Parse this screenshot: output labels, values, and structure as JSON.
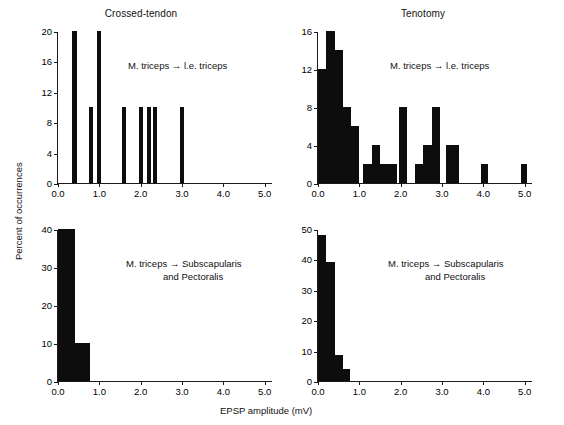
{
  "figure": {
    "ylabel": "Percent of occurrences",
    "xlabel": "EPSP amplitude (mV)"
  },
  "chart_data": [
    {
      "type": "bar",
      "panel_id": "top-left",
      "title": "Crossed-tendon",
      "annotation": "M. triceps → l.e. triceps",
      "xlabel": "EPSP amplitude (mV)",
      "ylabel": "Percent of occurrences",
      "xlim": [
        0.0,
        5.2
      ],
      "ylim": [
        0,
        20
      ],
      "xticks": [
        0.0,
        1.0,
        2.0,
        3.0,
        4.0,
        5.0
      ],
      "xtick_labels": [
        "0.0",
        "1.0",
        "2.0",
        "3.0",
        "4.0",
        "5.0"
      ],
      "yticks": [
        0,
        4,
        8,
        12,
        16,
        20
      ],
      "ytick_labels": [
        "0",
        "4",
        "8",
        "12",
        "16",
        "20"
      ],
      "bin_width": 0.1,
      "grid": false,
      "legend": "none",
      "bars": [
        {
          "x0": 0.35,
          "x1": 0.45,
          "value": 20
        },
        {
          "x0": 0.75,
          "x1": 0.85,
          "value": 10
        },
        {
          "x0": 0.95,
          "x1": 1.05,
          "value": 20
        },
        {
          "x0": 1.55,
          "x1": 1.65,
          "value": 10
        },
        {
          "x0": 1.95,
          "x1": 2.05,
          "value": 10
        },
        {
          "x0": 2.15,
          "x1": 2.25,
          "value": 10
        },
        {
          "x0": 2.3,
          "x1": 2.4,
          "value": 10
        },
        {
          "x0": 2.95,
          "x1": 3.05,
          "value": 10
        }
      ]
    },
    {
      "type": "bar",
      "panel_id": "top-right",
      "title": "Tenotomy",
      "annotation": "M. triceps → l.e. triceps",
      "xlabel": "EPSP amplitude (mV)",
      "ylabel": "Percent of occurrences",
      "xlim": [
        0.0,
        5.2
      ],
      "ylim": [
        0,
        16
      ],
      "xticks": [
        0.0,
        1.0,
        2.0,
        3.0,
        4.0,
        5.0
      ],
      "xtick_labels": [
        "0.0",
        "1.0",
        "2.0",
        "3.0",
        "4.0",
        "5.0"
      ],
      "yticks": [
        0,
        4,
        8,
        12,
        16
      ],
      "ytick_labels": [
        "0",
        "4",
        "8",
        "12",
        "16"
      ],
      "bin_width": 0.2,
      "grid": false,
      "legend": "none",
      "bars": [
        {
          "x0": 0.0,
          "x1": 0.2,
          "value": 12
        },
        {
          "x0": 0.2,
          "x1": 0.4,
          "value": 16
        },
        {
          "x0": 0.4,
          "x1": 0.6,
          "value": 14
        },
        {
          "x0": 0.6,
          "x1": 0.8,
          "value": 8
        },
        {
          "x0": 0.8,
          "x1": 1.0,
          "value": 6
        },
        {
          "x0": 1.1,
          "x1": 1.3,
          "value": 2
        },
        {
          "x0": 1.3,
          "x1": 1.5,
          "value": 4
        },
        {
          "x0": 1.5,
          "x1": 1.7,
          "value": 2
        },
        {
          "x0": 1.7,
          "x1": 1.9,
          "value": 2
        },
        {
          "x0": 1.95,
          "x1": 2.15,
          "value": 8
        },
        {
          "x0": 2.35,
          "x1": 2.55,
          "value": 2
        },
        {
          "x0": 2.55,
          "x1": 2.75,
          "value": 4
        },
        {
          "x0": 2.75,
          "x1": 2.95,
          "value": 8
        },
        {
          "x0": 3.1,
          "x1": 3.25,
          "value": 4
        },
        {
          "x0": 3.25,
          "x1": 3.4,
          "value": 4
        },
        {
          "x0": 3.95,
          "x1": 4.1,
          "value": 2
        },
        {
          "x0": 4.9,
          "x1": 5.05,
          "value": 2
        }
      ]
    },
    {
      "type": "bar",
      "panel_id": "bottom-left",
      "title": "",
      "annotation": "M. triceps → Subscapularis\n              and Pectoralis",
      "xlabel": "EPSP amplitude (mV)",
      "ylabel": "Percent of occurrences",
      "xlim": [
        0.0,
        5.2
      ],
      "ylim": [
        0,
        40
      ],
      "xticks": [
        0.0,
        1.0,
        2.0,
        3.0,
        4.0,
        5.0
      ],
      "xtick_labels": [
        "0.0",
        "1.0",
        "2.0",
        "3.0",
        "4.0",
        "5.0"
      ],
      "yticks": [
        0,
        10,
        20,
        30,
        40
      ],
      "ytick_labels": [
        "0",
        "10",
        "20",
        "30",
        "40"
      ],
      "bin_width": 0.2,
      "grid": false,
      "legend": "none",
      "bars": [
        {
          "x0": 0.0,
          "x1": 0.2,
          "value": 40
        },
        {
          "x0": 0.2,
          "x1": 0.4,
          "value": 40
        },
        {
          "x0": 0.4,
          "x1": 0.6,
          "value": 10
        },
        {
          "x0": 0.6,
          "x1": 0.78,
          "value": 10
        }
      ]
    },
    {
      "type": "bar",
      "panel_id": "bottom-right",
      "title": "",
      "annotation": "M. triceps → Subscapularis\n              and Pectoralis",
      "xlabel": "EPSP amplitude (mV)",
      "ylabel": "Percent of occurrences",
      "xlim": [
        0.0,
        5.2
      ],
      "ylim": [
        0,
        50
      ],
      "xticks": [
        0.0,
        1.0,
        2.0,
        3.0,
        4.0,
        5.0
      ],
      "xtick_labels": [
        "0.0",
        "1.0",
        "2.0",
        "3.0",
        "4.0",
        "5.0"
      ],
      "yticks": [
        0,
        10,
        20,
        30,
        40,
        50
      ],
      "ytick_labels": [
        "0",
        "10",
        "20",
        "30",
        "40",
        "50"
      ],
      "bin_width": 0.2,
      "grid": false,
      "legend": "none",
      "bars": [
        {
          "x0": 0.0,
          "x1": 0.2,
          "value": 48
        },
        {
          "x0": 0.2,
          "x1": 0.4,
          "value": 39
        },
        {
          "x0": 0.4,
          "x1": 0.6,
          "value": 8.5
        },
        {
          "x0": 0.6,
          "x1": 0.78,
          "value": 4
        }
      ]
    }
  ]
}
